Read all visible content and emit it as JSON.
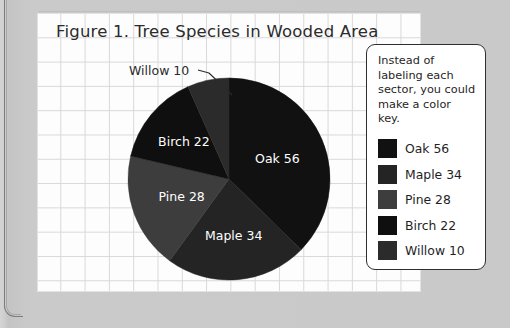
{
  "figure": {
    "title": "Figure 1. Tree Species in Wooded Area",
    "callout": {
      "label": "Willow 10",
      "leader_icon": "leader-line-icon"
    }
  },
  "legend_box": {
    "note": "Instead of labeling each sector, you could make a color key.",
    "items": [
      {
        "label": "Oak 56",
        "color": "#111111"
      },
      {
        "label": "Maple 34",
        "color": "#242424"
      },
      {
        "label": "Pine 28",
        "color": "#3d3d3d"
      },
      {
        "label": "Birch 22",
        "color": "#0f0f0f"
      },
      {
        "label": "Willow 10",
        "color": "#2b2b2b"
      }
    ]
  },
  "chart_data": {
    "type": "pie",
    "title": "Figure 1. Tree Species in Wooded Area",
    "categories": [
      "Oak",
      "Maple",
      "Pine",
      "Birch",
      "Willow"
    ],
    "values": [
      56,
      34,
      28,
      22,
      10
    ],
    "total": 150,
    "labels": [
      "Oak 56",
      "Maple 34",
      "Pine 28",
      "Birch 22",
      "Willow 10"
    ],
    "colors": [
      "#111111",
      "#242424",
      "#3d3d3d",
      "#0f0f0f",
      "#2b2b2b"
    ],
    "start_angle_deg": 0,
    "direction": "clockwise",
    "legend_position": "right",
    "grid": true,
    "annotations": [
      "Willow 10 label with leader line to the Willow sector"
    ]
  },
  "colors": {
    "page_background": "#c9c9c9",
    "sheet_background": "#fdfdfd",
    "grid_line": "#d8d8d8",
    "text": "#2b2b2b",
    "sector_label_text": "#ffffff",
    "legend_border": "#2f2f2f"
  }
}
